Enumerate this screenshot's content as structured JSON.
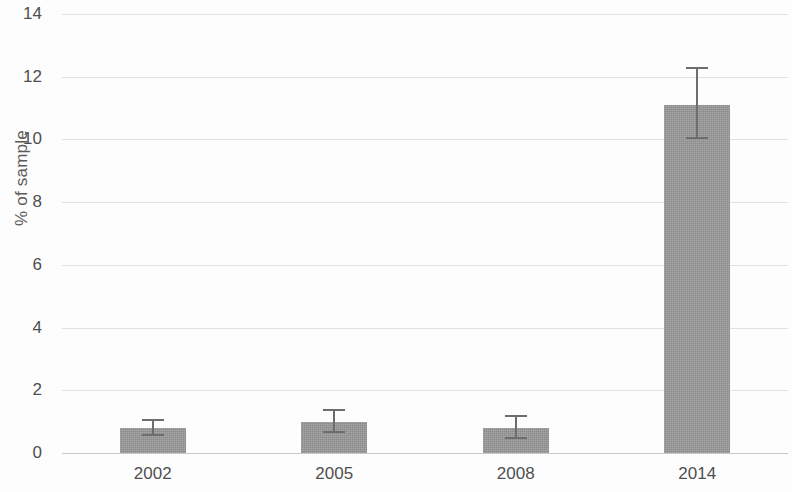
{
  "chart_data": {
    "type": "bar",
    "title": "",
    "subtitle": "",
    "xlabel": "",
    "ylabel": "% of sample",
    "categories": [
      "2002",
      "2005",
      "2008",
      "2014"
    ],
    "values": [
      0.8,
      1.0,
      0.8,
      11.1
    ],
    "error_low": [
      0.55,
      0.65,
      0.45,
      10.0
    ],
    "error_high": [
      1.1,
      1.4,
      1.2,
      12.3
    ],
    "error_type": "error-bars",
    "ylim": [
      0,
      14
    ],
    "yticks": [
      0,
      2,
      4,
      6,
      8,
      10,
      12,
      14
    ],
    "ytick_labels": [
      "0",
      "2",
      "4",
      "6",
      "8",
      "10",
      "12",
      "14"
    ],
    "grid": "horizontal",
    "legend": "none",
    "bar_color": "#9b9b9b",
    "error_color": "#6d6d6d",
    "grid_color": "#e2e2e2",
    "axis_color": "#c9c9c9",
    "background": "#fdfdfd"
  }
}
